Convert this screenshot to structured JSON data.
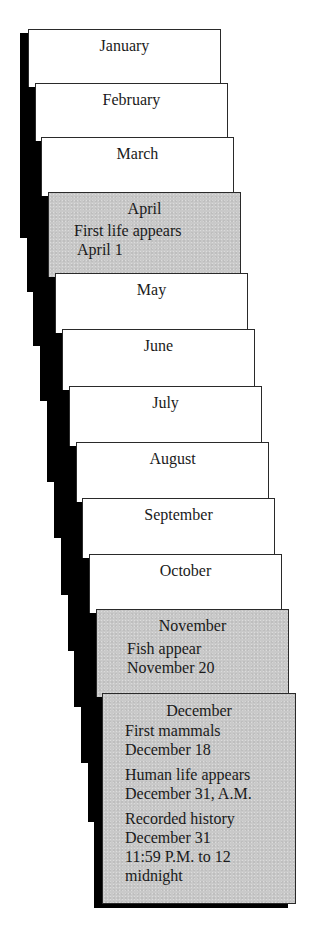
{
  "diagram": {
    "pages": [
      {
        "month": "January",
        "events": []
      },
      {
        "month": "February",
        "events": []
      },
      {
        "month": "March",
        "events": []
      },
      {
        "month": "April",
        "highlight": true,
        "events": [
          {
            "lines": [
              "First life appears",
              "April 1"
            ]
          }
        ]
      },
      {
        "month": "May",
        "events": []
      },
      {
        "month": "June",
        "events": []
      },
      {
        "month": "July",
        "events": []
      },
      {
        "month": "August",
        "events": []
      },
      {
        "month": "September",
        "events": []
      },
      {
        "month": "October",
        "events": []
      },
      {
        "month": "November",
        "highlight": true,
        "events": [
          {
            "lines": [
              "Fish appear",
              "November 20"
            ]
          }
        ]
      },
      {
        "month": "December",
        "highlight": true,
        "events": [
          {
            "lines": [
              "First mammals",
              "December 18"
            ]
          },
          {
            "lines": [
              "Human life appears",
              "December 31, A.M."
            ]
          },
          {
            "lines": [
              "Recorded history",
              "December 31",
              "11:59 P.M. to 12",
              "midnight"
            ]
          }
        ]
      }
    ]
  },
  "colors": {
    "page_background": "#ffffff",
    "highlight_background": "#c9c9c9",
    "shadow": "#000000",
    "border": "#2a2a2a",
    "text": "#1a1a1a"
  }
}
